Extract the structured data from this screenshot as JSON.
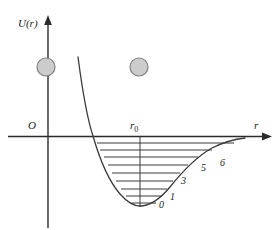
{
  "figure": {
    "type": "potential-energy-diagram",
    "axes": {
      "y_label": "U(r)",
      "x_label": "r",
      "origin_label": "O",
      "equilibrium_label_main": "r",
      "equilibrium_label_sub": "0"
    },
    "colors": {
      "line": "#3a3a3a",
      "axis": "#2b2b2b",
      "atom_fill": "#cccccc",
      "atom_stroke": "#808080",
      "background": "#ffffff"
    },
    "atoms": [
      {
        "name": "atom-on-axis",
        "cx": 46,
        "cy": 67,
        "r": 9
      },
      {
        "name": "atom-free",
        "cx": 139,
        "cy": 67,
        "r": 9
      }
    ],
    "energy_levels": [
      {
        "label": "0",
        "y": 203,
        "x1": 132,
        "x2": 156,
        "label_x": 159,
        "label_y": 200
      },
      {
        "label": "1",
        "y": 196,
        "x1": 126,
        "x2": 162,
        "label_x": 170,
        "label_y": 192
      },
      {
        "label": "",
        "y": 189,
        "x1": 121,
        "x2": 167,
        "label_x": 0,
        "label_y": 0
      },
      {
        "label": "3",
        "y": 181,
        "x1": 116,
        "x2": 173,
        "label_x": 181,
        "label_y": 176
      },
      {
        "label": "",
        "y": 173,
        "x1": 112,
        "x2": 180,
        "label_x": 0,
        "label_y": 0
      },
      {
        "label": "5",
        "y": 165,
        "x1": 108,
        "x2": 188,
        "label_x": 201,
        "label_y": 163
      },
      {
        "label": "6",
        "y": 157,
        "x1": 104,
        "x2": 198,
        "label_x": 220,
        "label_y": 158
      },
      {
        "label": "",
        "y": 150,
        "x1": 100,
        "x2": 212,
        "label_x": 0,
        "label_y": 0
      },
      {
        "label": "",
        "y": 143,
        "x1": 97,
        "x2": 234,
        "label_x": 0,
        "label_y": 0
      }
    ]
  },
  "chart_data": {
    "type": "line",
    "title": "",
    "xlabel": "r",
    "ylabel": "U(r)",
    "annotations": [
      "O",
      "r0",
      "0",
      "1",
      "3",
      "5",
      "6"
    ],
    "series": [
      {
        "name": "interatomic potential U(r)",
        "description": "Lennard-Jones / Morse type potential well with minimum at r0"
      }
    ],
    "vibrational_levels": [
      "0",
      "1",
      "3",
      "5",
      "6"
    ],
    "grid": false,
    "legend": "none"
  }
}
